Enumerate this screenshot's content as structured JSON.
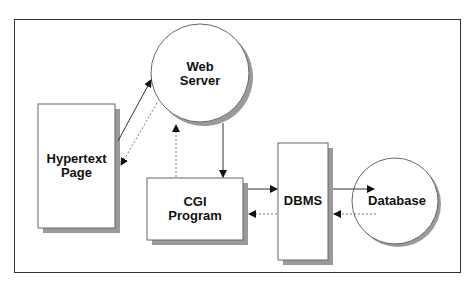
{
  "diagram": {
    "nodes": {
      "web_server": {
        "line1": "Web",
        "line2": "Server",
        "shape": "circle"
      },
      "hypertext_page": {
        "line1": "Hypertext",
        "line2": "Page",
        "shape": "rectangle"
      },
      "cgi_program": {
        "line1": "CGI",
        "line2": "Program",
        "shape": "rectangle"
      },
      "dbms": {
        "label": "DBMS",
        "shape": "rectangle"
      },
      "database": {
        "label": "Database",
        "shape": "circle"
      }
    },
    "edges": [
      {
        "from": "Hypertext Page",
        "to": "Web Server",
        "style": "solid"
      },
      {
        "from": "Web Server",
        "to": "Hypertext Page",
        "style": "dotted"
      },
      {
        "from": "Web Server",
        "to": "CGI Program",
        "style": "solid"
      },
      {
        "from": "CGI Program",
        "to": "Web Server",
        "style": "dotted"
      },
      {
        "from": "CGI Program",
        "to": "DBMS",
        "style": "solid"
      },
      {
        "from": "DBMS",
        "to": "CGI Program",
        "style": "dotted"
      },
      {
        "from": "DBMS",
        "to": "Database",
        "style": "solid"
      },
      {
        "from": "Database",
        "to": "DBMS",
        "style": "dotted"
      }
    ],
    "colors": {
      "stroke": "#333333",
      "shadow": "#999999",
      "fill": "#ffffff"
    }
  }
}
